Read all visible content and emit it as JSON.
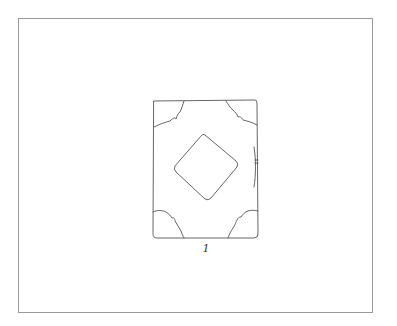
{
  "figure": {
    "page_number": "1",
    "colors": {
      "background": "#ffffff",
      "frame": "#9a9a9a",
      "line": "#555555"
    }
  }
}
